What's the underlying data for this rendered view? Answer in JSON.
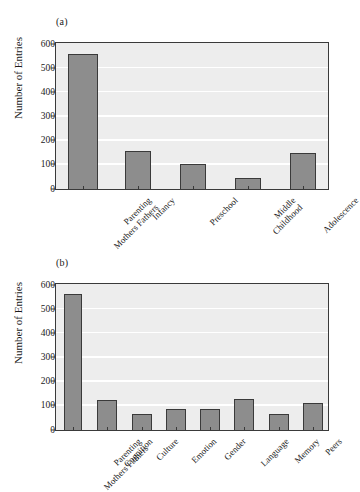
{
  "figure": {
    "background": "#ffffff",
    "bar_color": "#8d8d8d",
    "bar_edge_color": "#3a3a3a",
    "plot_background": "#ededed",
    "gridline_color": "#ffffff"
  },
  "panels": [
    {
      "id": "a",
      "label": "(a)",
      "ylabel": "Number of Entries",
      "yticks": [
        "600",
        "500",
        "400",
        "300",
        "200",
        "100",
        "0"
      ]
    },
    {
      "id": "b",
      "label": "(b)",
      "ylabel": "Number of Entries",
      "yticks": [
        "600",
        "500",
        "400",
        "300",
        "200",
        "100",
        "0"
      ]
    }
  ],
  "chart_data": [
    {
      "type": "bar",
      "title": "(a)",
      "xlabel": "",
      "ylabel": "Number of Entries",
      "ylim": [
        0,
        600
      ],
      "ytick_values": [
        0,
        100,
        200,
        300,
        400,
        500,
        600
      ],
      "grid": true,
      "legend": "none",
      "categories": [
        "Parenting\nMothers Fathers",
        "Infancy",
        "Preschool",
        "Middle\nChildhood",
        "Adolescence"
      ],
      "category_lines": [
        [
          "Parenting",
          "Mothers Fathers"
        ],
        [
          "Infancy"
        ],
        [
          "Preschool"
        ],
        [
          "Middle",
          "Childhood"
        ],
        [
          "Adolescence"
        ]
      ],
      "values": [
        560,
        157,
        105,
        45,
        148
      ]
    },
    {
      "type": "bar",
      "title": "(b)",
      "xlabel": "",
      "ylabel": "Number of Entries",
      "ylim": [
        0,
        600
      ],
      "ytick_values": [
        0,
        100,
        200,
        300,
        400,
        500,
        600
      ],
      "grid": true,
      "legend": "none",
      "categories": [
        "Parenting\nMothers Fathers",
        "Cognition",
        "Culture",
        "Emotion",
        "Gender",
        "Language",
        "Memory",
        "Peers"
      ],
      "category_lines": [
        [
          "Parenting",
          "Mothers Fathers"
        ],
        [
          "Cognition"
        ],
        [
          "Culture"
        ],
        [
          "Emotion"
        ],
        [
          "Gender"
        ],
        [
          "Language"
        ],
        [
          "Memory"
        ],
        [
          "Peers"
        ]
      ],
      "values": [
        563,
        123,
        68,
        88,
        88,
        128,
        65,
        110
      ]
    }
  ]
}
